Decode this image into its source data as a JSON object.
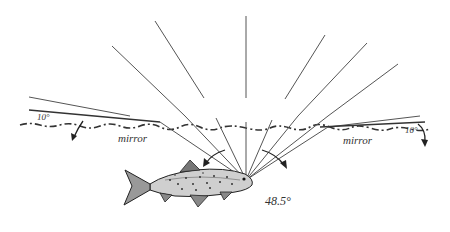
{
  "diagram": {
    "labels": {
      "mirror_left": "mirror",
      "mirror_right": "mirror",
      "angle_left": "10°",
      "angle_right": "10°",
      "window_half_angle": "48.5°"
    },
    "colors": {
      "line": "#555555",
      "surface": "#333333",
      "text": "#333333"
    },
    "eye_point": [
      246,
      180
    ]
  }
}
